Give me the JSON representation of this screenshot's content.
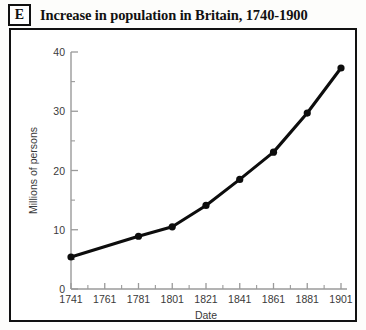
{
  "figure": {
    "tag": "E",
    "title": "Increase in population in Britain, 1740-1900"
  },
  "chart_data": {
    "type": "line",
    "title": "Increase in population in Britain, 1740-1900",
    "xlabel": "Date",
    "ylabel": "Millions of persons",
    "xlim": [
      1741,
      1901
    ],
    "ylim": [
      0,
      40
    ],
    "grid": false,
    "legend": null,
    "x": [
      1741,
      1781,
      1801,
      1821,
      1841,
      1861,
      1881,
      1901
    ],
    "values": [
      5.4,
      8.9,
      10.5,
      14.1,
      18.5,
      23.1,
      29.7,
      37.3
    ],
    "points": [
      {
        "x": 1741,
        "y": 5.4
      },
      {
        "x": 1781,
        "y": 8.9
      },
      {
        "x": 1801,
        "y": 10.5
      },
      {
        "x": 1821,
        "y": 14.1
      },
      {
        "x": 1841,
        "y": 18.5
      },
      {
        "x": 1861,
        "y": 23.1
      },
      {
        "x": 1881,
        "y": 29.7
      },
      {
        "x": 1901,
        "y": 37.3
      }
    ],
    "x_tick_labels": [
      "1741",
      "1761",
      "1781",
      "1801",
      "1821",
      "1841",
      "1861",
      "1881",
      "1901"
    ],
    "x_tick_values": [
      1741,
      1761,
      1781,
      1801,
      1821,
      1841,
      1861,
      1881,
      1901
    ],
    "x_minor_ticks": [
      1751,
      1771,
      1791,
      1811,
      1831,
      1851,
      1871,
      1891
    ],
    "y_tick_labels": [
      "0",
      "10",
      "20",
      "30",
      "40"
    ],
    "y_tick_values": [
      0,
      10,
      20,
      30,
      40
    ],
    "y_minor_ticks": [
      5,
      15,
      25,
      35
    ],
    "series_color": "#0d0d0d",
    "axis_color": "#9a9a9a",
    "marker": "filled-circle"
  }
}
